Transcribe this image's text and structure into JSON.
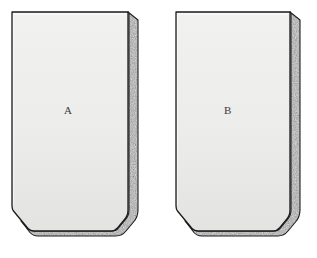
{
  "figure": {
    "background_color": "#ffffff",
    "width": 317,
    "height": 258,
    "face_fill_color": "#eeeeec",
    "face_fill_color_bottom": "#e4e4e2",
    "edge_band_color": "#9a9a9a",
    "edge_band_light": "#c9c9c9",
    "edge_band_dark": "#6f6f6f",
    "outline_color": "#1a1a1a",
    "shapes": [
      {
        "id": "shape-a",
        "label": "A",
        "label_x": 68,
        "label_y": 110,
        "front_face_path": "M 12,12 L 128,12 L 128,214 L 114,228 L 30,228 L 12,207 Z",
        "side_band_path": "M 128,12 L 138,20 L 138,218 L 124,236 L 34,236 L 21,221 L 30,228 L 114,228 L 128,214 Z",
        "geometry": {
          "top_left": [
            12,
            12
          ],
          "top_right": [
            128,
            12
          ],
          "bottom_right": [
            128,
            214
          ],
          "bottom_right_lower": [
            114,
            228
          ],
          "bottom_left_lower": [
            30,
            228
          ],
          "chamfer_top": [
            12,
            207
          ],
          "depth_offset_x": 10,
          "depth_offset_y": 8
        }
      },
      {
        "id": "shape-b",
        "label": "B",
        "label_x": 228,
        "label_y": 110,
        "front_face_path": "M 176,12 L 290,12 L 290,214 L 276,228 L 194,228 L 176,207 Z",
        "side_band_path": "M 290,12 L 300,20 L 300,218 L 286,236 L 198,236 L 185,221 L 194,228 L 276,228 L 290,214 Z",
        "geometry": {
          "top_left": [
            176,
            12
          ],
          "top_right": [
            290,
            12
          ],
          "bottom_right": [
            290,
            214
          ],
          "bottom_right_lower": [
            276,
            228
          ],
          "bottom_left_lower": [
            194,
            228
          ],
          "chamfer_top": [
            176,
            207
          ],
          "depth_offset_x": 10,
          "depth_offset_y": 8
        }
      }
    ]
  }
}
